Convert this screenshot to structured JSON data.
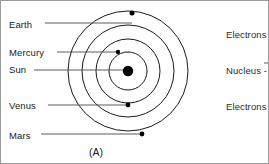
{
  "figure": {
    "caption": "(A)"
  },
  "left_labels": [
    {
      "name": "earth",
      "text": "Earth",
      "x": 8,
      "y": 19,
      "line_from_x": 44,
      "line_to_x": 131,
      "line_y": 22
    },
    {
      "name": "mercury",
      "text": "Mercury",
      "x": 8,
      "y": 47,
      "line_from_x": 56,
      "line_to_x": 118,
      "line_y": 51
    },
    {
      "name": "sun",
      "text": "Sun",
      "x": 8,
      "y": 64,
      "line_from_x": 33,
      "line_to_x": 126,
      "line_y": 69
    },
    {
      "name": "venus",
      "text": "Venus",
      "x": 8,
      "y": 100,
      "line_from_x": 47,
      "line_to_x": 127,
      "line_y": 104
    },
    {
      "name": "mars",
      "text": "Mars",
      "x": 8,
      "y": 130,
      "line_from_x": 40,
      "line_to_x": 141,
      "line_y": 133
    }
  ],
  "right_labels": [
    {
      "name": "electrons-top",
      "text": "Electrons",
      "x": 225,
      "y": 29
    },
    {
      "name": "nucleus",
      "text": "Nucleus -",
      "x": 225,
      "y": 65
    },
    {
      "name": "electrons-bottom",
      "text": "Electrons",
      "x": 225,
      "y": 101
    }
  ],
  "diagram": {
    "center": {
      "x": 127,
      "y": 70
    },
    "nucleus_radius": 5.2,
    "orbits": [
      {
        "name": "orbit-1-mercury",
        "radius": 19
      },
      {
        "name": "orbit-2-venus",
        "radius": 32
      },
      {
        "name": "orbit-3-earth",
        "radius": 46
      },
      {
        "name": "orbit-4-mars",
        "radius": 60
      }
    ],
    "particles": [
      {
        "name": "particle-mercury",
        "x": 117,
        "y": 51,
        "radius": 2.2
      },
      {
        "name": "particle-earth",
        "x": 131,
        "y": 12,
        "radius": 2.5
      },
      {
        "name": "particle-venus",
        "x": 127,
        "y": 104,
        "radius": 2.4
      },
      {
        "name": "particle-mars",
        "x": 141,
        "y": 133,
        "radius": 2.4
      }
    ]
  },
  "colors": {
    "stroke": "#1a1a1a",
    "leader": "#4a4a4a",
    "text": "#1a1a1a",
    "background": "#ffffff",
    "frame": "#9a9a9a"
  },
  "caption_position": {
    "x": 88,
    "y": 146
  }
}
